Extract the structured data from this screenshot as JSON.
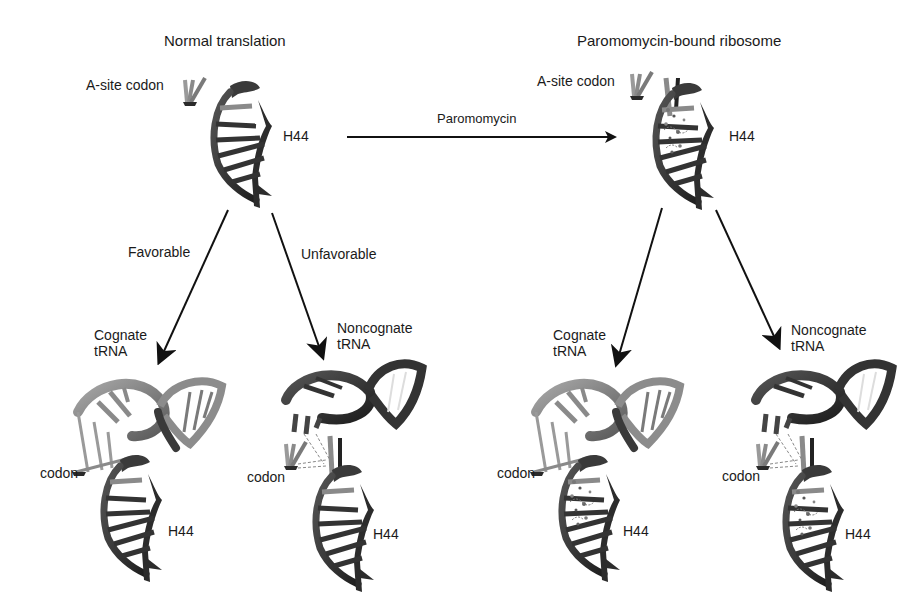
{
  "panels": {
    "left": {
      "title": "Normal translation",
      "asite_label": "A-site codon",
      "h44_label": "H44",
      "branches": {
        "favorable": "Favorable",
        "unfavorable": "Unfavorable"
      },
      "cognate": {
        "trna_label_1": "Cognate",
        "trna_label_2": "tRNA",
        "codon_label": "codon",
        "h44_label": "H44"
      },
      "noncognate": {
        "trna_label_1": "Noncognate",
        "trna_label_2": "tRNA",
        "codon_label": "codon",
        "h44_label": "H44"
      }
    },
    "right": {
      "title": "Paromomycin-bound ribosome",
      "asite_label": "A-site codon",
      "h44_label": "H44",
      "cognate": {
        "trna_label_1": "Cognate",
        "trna_label_2": "tRNA",
        "codon_label": "codon",
        "h44_label": "H44"
      },
      "noncognate": {
        "trna_label_1": "Noncognate",
        "trna_label_2": "tRNA",
        "codon_label": "codon",
        "h44_label": "H44"
      }
    }
  },
  "transition_arrow": {
    "label": "Paromomycin"
  },
  "colors": {
    "text": "#1a1a1a",
    "dark_rna": "#2e2e2e",
    "mid_rna": "#6e6e6e",
    "light_rna": "#9a9a9a",
    "arrow": "#111111"
  }
}
